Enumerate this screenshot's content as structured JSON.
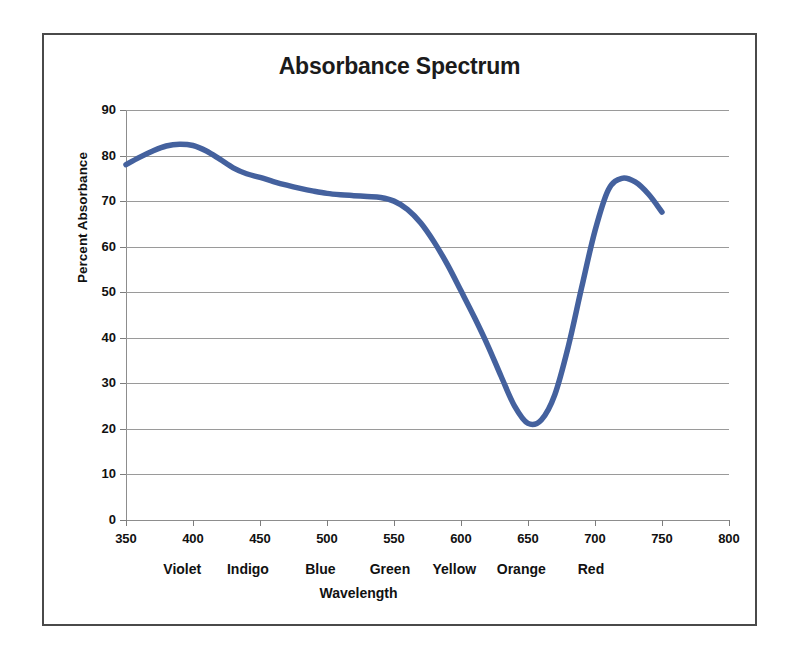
{
  "chart_data": {
    "type": "line",
    "title": "Absorbance Spectrum",
    "xlabel": "Wavelength",
    "ylabel": "Percent Absorbance",
    "xlim": [
      350,
      800
    ],
    "ylim": [
      0,
      90
    ],
    "grid": true,
    "legend": "none",
    "x_ticks": [
      350,
      400,
      450,
      500,
      550,
      600,
      650,
      700,
      750,
      800
    ],
    "y_ticks": [
      0,
      10,
      20,
      30,
      40,
      50,
      60,
      70,
      80,
      90
    ],
    "line_color": "#44619e",
    "series": [
      {
        "name": "Percent Absorbance",
        "x": [
          350,
          360,
          370,
          380,
          390,
          400,
          410,
          420,
          430,
          440,
          450,
          460,
          470,
          480,
          490,
          500,
          510,
          520,
          530,
          540,
          550,
          560,
          570,
          580,
          590,
          600,
          610,
          620,
          630,
          640,
          650,
          660,
          670,
          680,
          690,
          700,
          710,
          720,
          730,
          740,
          750
        ],
        "y": [
          78.0,
          79.6,
          81.0,
          82.1,
          82.5,
          82.2,
          81.0,
          79.2,
          77.3,
          76.0,
          75.2,
          74.3,
          73.5,
          72.8,
          72.2,
          71.7,
          71.4,
          71.2,
          71.0,
          70.8,
          70.0,
          68.2,
          65.2,
          61.0,
          56.0,
          50.3,
          44.5,
          38.3,
          31.5,
          25.0,
          21.2,
          22.0,
          27.5,
          38.0,
          51.0,
          63.5,
          72.5,
          75.0,
          74.2,
          71.5,
          67.6
        ]
      }
    ],
    "color_bands": [
      {
        "label": "Violet",
        "center_nm": 392
      },
      {
        "label": "Indigo",
        "center_nm": 441
      },
      {
        "label": "Blue",
        "center_nm": 495
      },
      {
        "label": "Green",
        "center_nm": 547
      },
      {
        "label": "Yellow",
        "center_nm": 595
      },
      {
        "label": "Orange",
        "center_nm": 645
      },
      {
        "label": "Red",
        "center_nm": 697
      }
    ],
    "annotations": {
      "peak_near_400": 82.5,
      "trough_near_650": 21.2,
      "peak_near_710": 75.0
    }
  }
}
